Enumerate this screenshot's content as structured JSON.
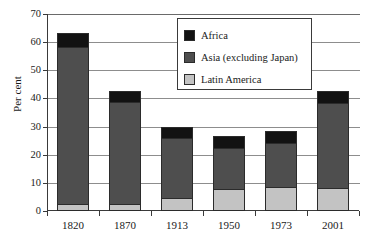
{
  "chart_data": {
    "type": "bar",
    "subtype": "stacked-column",
    "title": "",
    "subtitle": "",
    "xlabel": "",
    "ylabel": "Per cent",
    "categories": [
      "1820",
      "1870",
      "1913",
      "1950",
      "1973",
      "2001"
    ],
    "ylim": [
      0,
      70
    ],
    "yticks": [
      0,
      10,
      20,
      30,
      40,
      50,
      60,
      70
    ],
    "ytick_labels": [
      "0",
      "10",
      "20",
      "30",
      "40",
      "50",
      "60",
      "70"
    ],
    "grid": true,
    "grid_axis": "y",
    "legend_position": "upper-center",
    "series": [
      {
        "name": "Latin America",
        "color": "#c3c3c3",
        "values": [
          2.2,
          2.3,
          4.2,
          7.5,
          8.5,
          7.9
        ]
      },
      {
        "name": "Asia (excluding Japan)",
        "color": "#4e4e4e",
        "values": [
          56.4,
          36.7,
          22.1,
          15.3,
          16.0,
          30.6
        ]
      },
      {
        "name": "Africa",
        "color": "#121212",
        "values": [
          4.5,
          3.6,
          3.4,
          4.0,
          3.8,
          4.0
        ]
      }
    ],
    "stack_tops": {
      "latin": [
        2.2,
        2.3,
        4.2,
        7.5,
        8.5,
        7.9
      ],
      "asia": [
        58.6,
        39.0,
        26.3,
        22.8,
        24.5,
        38.5
      ],
      "total": [
        63.1,
        42.6,
        29.7,
        26.8,
        28.3,
        42.5
      ]
    }
  },
  "legend": {
    "items": [
      {
        "label": "Africa",
        "swatch": "black-swatch"
      },
      {
        "label": "Asia (excluding Japan)",
        "swatch": "dark-gray-swatch"
      },
      {
        "label": "Latin America",
        "swatch": "light-gray-swatch"
      }
    ]
  }
}
